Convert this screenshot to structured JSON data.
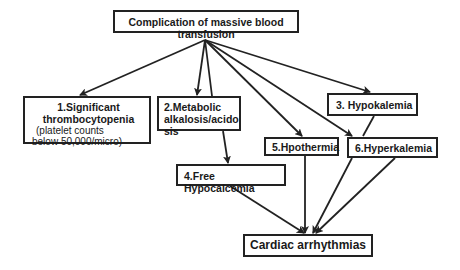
{
  "diagram": {
    "title_node": {
      "label": "Complication of massive blood transfusion"
    },
    "nodes": [
      {
        "id": "n1",
        "title_line1": "1.Significant",
        "title_line2": "thrombocytopenia",
        "sub_line1": "(platelet counts",
        "sub_line2": "below 50,000/micro)"
      },
      {
        "id": "n2",
        "line1": "2.Metabolic",
        "line2": "alkalosis/acido",
        "line3": "sis"
      },
      {
        "id": "n3",
        "label": "3.  Hypokalemia"
      },
      {
        "id": "n4",
        "label": "4.Free Hypocalcemia"
      },
      {
        "id": "n5",
        "label": "5.Hpothermia"
      },
      {
        "id": "n6",
        "label": "6.Hyperkalemia"
      }
    ],
    "outcome_node": {
      "label": "Cardiac arrhythmias"
    },
    "edges": [
      {
        "from": "title",
        "to": "n1"
      },
      {
        "from": "title",
        "to": "n2"
      },
      {
        "from": "title",
        "to": "n3"
      },
      {
        "from": "title",
        "to": "n5"
      },
      {
        "from": "title",
        "to": "n6"
      },
      {
        "from": "title",
        "to": "outcome"
      },
      {
        "from": "n2",
        "to": "n4"
      },
      {
        "from": "n3",
        "to": "n6"
      },
      {
        "from": "n4",
        "to": "outcome"
      },
      {
        "from": "n5",
        "to": "outcome"
      },
      {
        "from": "n6",
        "to": "outcome"
      }
    ],
    "colors": {
      "stroke": "#222222",
      "background": "#ffffff",
      "text": "#1a1a1a"
    }
  }
}
